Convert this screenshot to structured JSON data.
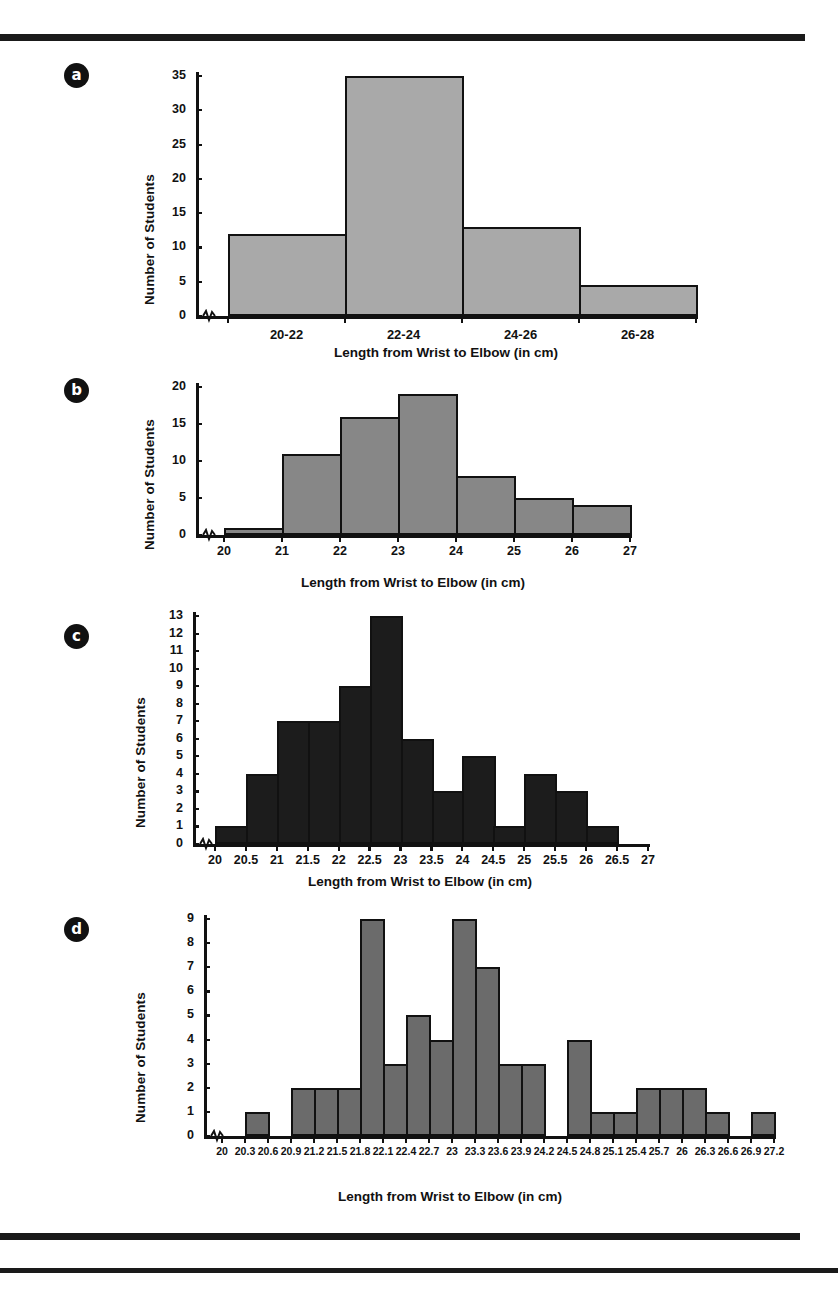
{
  "figure": {
    "axis_title_x": "Length from Wrist to Elbow (in cm)",
    "axis_title_y": "Number of Students",
    "panel_labels": [
      "a",
      "b",
      "c",
      "d"
    ],
    "bar_colors": {
      "a": "#a9a9a9",
      "b": "#878787",
      "c": "#1c1c1c",
      "d": "#6b6b6b"
    },
    "outline_color": "#111111"
  },
  "chart_data": [
    {
      "panel": "a",
      "type": "bar",
      "title": "",
      "xlabel": "Length from Wrist to Elbow (in cm)",
      "ylabel": "Number of Students",
      "categories": [
        "20-22",
        "22-24",
        "24-26",
        "26-28"
      ],
      "values": [
        12,
        35,
        13,
        4.5
      ],
      "ylim": [
        0,
        35
      ],
      "yticks": [
        0,
        5,
        10,
        15,
        20,
        25,
        30,
        35
      ],
      "grid": false,
      "axis_break_x": true,
      "legend": "none"
    },
    {
      "panel": "b",
      "type": "bar",
      "title": "",
      "xlabel": "Length from Wrist to Elbow (in cm)",
      "ylabel": "Number of Students",
      "bin_edges": [
        20,
        21,
        22,
        23,
        24,
        25,
        26,
        27
      ],
      "xticks": [
        "20",
        "21",
        "22",
        "23",
        "24",
        "25",
        "26",
        "27"
      ],
      "values": [
        1,
        11,
        16,
        19,
        8,
        5,
        4
      ],
      "ylim": [
        0,
        20
      ],
      "yticks": [
        0,
        5,
        10,
        15,
        20
      ],
      "grid": false,
      "axis_break_x": true,
      "legend": "none"
    },
    {
      "panel": "c",
      "type": "bar",
      "title": "",
      "xlabel": "Length from Wrist to Elbow (in cm)",
      "ylabel": "Number of Students",
      "bin_edges": [
        20.5,
        21,
        21.5,
        22,
        22.5,
        23,
        23.5,
        24,
        24.5,
        25,
        25.5,
        26,
        26.5,
        27
      ],
      "xticks": [
        "20",
        "20.5",
        "21",
        "21.5",
        "22",
        "22.5",
        "23",
        "23.5",
        "24",
        "24.5",
        "25",
        "25.5",
        "26",
        "26.5",
        "27"
      ],
      "values": [
        1,
        4,
        7,
        7,
        9,
        13,
        6,
        3,
        5,
        1,
        4,
        3,
        1
      ],
      "ylim": [
        0,
        13
      ],
      "yticks": [
        0,
        1,
        2,
        3,
        4,
        5,
        6,
        7,
        8,
        9,
        10,
        11,
        12,
        13
      ],
      "grid": false,
      "axis_break_x": true,
      "legend": "none"
    },
    {
      "panel": "d",
      "type": "bar",
      "title": "",
      "xlabel": "Length from Wrist to Elbow (in cm)",
      "ylabel": "Number of Students",
      "xticks": [
        "20",
        "20.3",
        "20.6",
        "20.9",
        "21.2",
        "21.5",
        "21.8",
        "22.1",
        "22.4",
        "22.7",
        "23",
        "23.3",
        "23.6",
        "23.9",
        "24.2",
        "24.5",
        "24.8",
        "25.1",
        "25.4",
        "25.7",
        "26",
        "26.3",
        "26.6",
        "26.9",
        "27.2"
      ],
      "values": [
        0,
        1,
        0,
        2,
        2,
        2,
        9,
        3,
        5,
        4,
        9,
        7,
        3,
        3,
        0,
        4,
        1,
        1,
        2,
        2,
        2,
        1,
        0,
        1
      ],
      "ylim": [
        0,
        9
      ],
      "yticks": [
        0,
        1,
        2,
        3,
        4,
        5,
        6,
        7,
        8,
        9
      ],
      "grid": false,
      "axis_break_x": true,
      "legend": "none"
    }
  ]
}
